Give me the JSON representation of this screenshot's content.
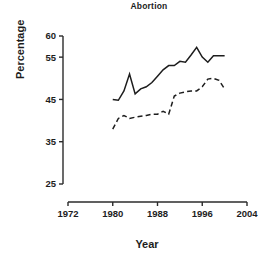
{
  "chart_data": {
    "type": "line",
    "title": "Abortion",
    "xlabel": "Year",
    "ylabel": "Percentage",
    "xlim": [
      1970,
      2006
    ],
    "ylim": [
      25,
      60
    ],
    "grid": false,
    "legend": "none",
    "xticks": [
      1972,
      1980,
      1988,
      1996,
      2004
    ],
    "xtick_labels": [
      "1972",
      "1980",
      "1988",
      "1996",
      "2004"
    ],
    "yticks": [
      25,
      35,
      45,
      55,
      60
    ],
    "ytick_labels": [
      "25",
      "35",
      "45",
      "55",
      "60"
    ],
    "x": [
      1980,
      1981,
      1982,
      1983,
      1984,
      1985,
      1986,
      1987,
      1988,
      1989,
      1990,
      1991,
      1992,
      1993,
      1994,
      1995,
      1996,
      1997,
      1998,
      1999,
      2000
    ],
    "series": [
      {
        "name": "solid-line",
        "style": "solid",
        "values": [
          45.0,
          44.8,
          47.0,
          51.0,
          46.3,
          47.5,
          48.0,
          49.0,
          50.5,
          52.0,
          53.0,
          53.0,
          54.0,
          53.8,
          55.5,
          57.3,
          55.0,
          53.8,
          55.3,
          55.3,
          55.3
        ]
      },
      {
        "name": "dashed-line",
        "style": "dashed",
        "values": [
          38.0,
          40.5,
          41.2,
          40.5,
          40.8,
          41.0,
          41.2,
          41.5,
          41.5,
          42.2,
          41.5,
          45.8,
          46.5,
          46.8,
          47.0,
          47.0,
          48.0,
          49.8,
          50.0,
          49.5,
          47.5
        ]
      }
    ]
  },
  "axis": {
    "tick_length": 4
  }
}
